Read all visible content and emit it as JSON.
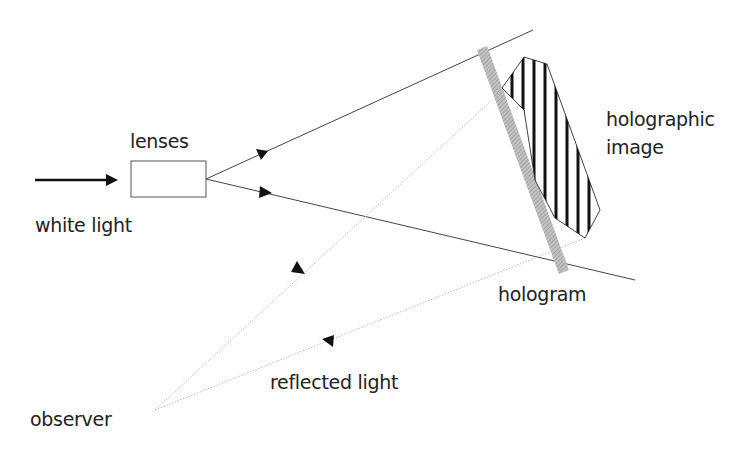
{
  "diagram": {
    "type": "reflection hologram viewing setup",
    "labels": {
      "lenses": "lenses",
      "white_light": "white light",
      "holographic_image_line1": "holographic",
      "holographic_image_line2": "image",
      "hologram": "hologram",
      "reflected_light": "reflected light",
      "observer": "observer"
    },
    "colors": {
      "line": "#333333",
      "hologram_plate": "#a8a8a8",
      "reflected_ray": "#bbbbbb",
      "stripes": "#111111"
    }
  }
}
